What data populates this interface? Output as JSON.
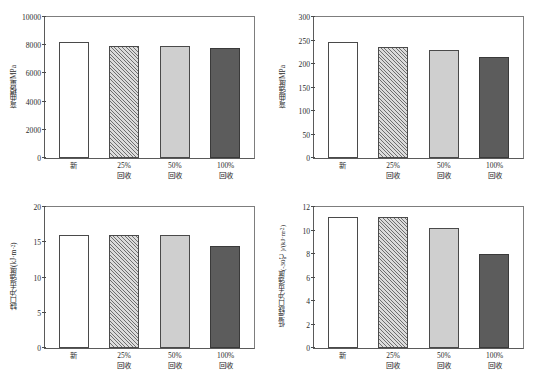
{
  "figure": {
    "panel_count": 4,
    "categories": [
      "新",
      "25%\n回收",
      "50%\n回收",
      "100%\n回收"
    ],
    "category_lines": [
      {
        "l1": "新",
        "l2": ""
      },
      {
        "l1": "25%",
        "l2": "回收"
      },
      {
        "l1": "50%",
        "l2": "回收"
      },
      {
        "l1": "100%",
        "l2": "回收"
      }
    ],
    "bar_styles": [
      "white-outline",
      "diagonal-hatch",
      "light-gray",
      "dark-gray"
    ],
    "colors": {
      "bar_white": "#ffffff",
      "bar_hatch_bg": "#dcdcdc",
      "bar_hatch_line": "#6f6f6f",
      "bar_light_gray": "#cfcfcf",
      "bar_dark_gray": "#5c5c5c",
      "axis": "#4a4a4a",
      "frame": "#5a5a5a",
      "text": "#2b2b2b",
      "background": "#ffffff"
    }
  },
  "chart_data": [
    {
      "id": "flexural-modulus",
      "type": "bar",
      "title": "",
      "xlabel": "",
      "ylabel": "弯曲模量/MPa",
      "ylabel_plain": "弯曲模量/MPa",
      "categories": [
        "新",
        "25%回收",
        "50%回收",
        "100%回收"
      ],
      "values": [
        8200,
        7970,
        7930,
        7800
      ],
      "ylim": [
        0,
        10000
      ],
      "yticks": [
        0,
        2000,
        4000,
        6000,
        8000,
        10000
      ],
      "ytick_labels": [
        "0",
        "2000",
        "4000",
        "6000",
        "8000",
        "10000"
      ],
      "grid": false,
      "legend": null
    },
    {
      "id": "flexural-strength",
      "type": "bar",
      "title": "",
      "xlabel": "",
      "ylabel": "弯曲强度/MPa",
      "ylabel_plain": "弯曲强度/MPa",
      "categories": [
        "新",
        "25%回收",
        "50%回收",
        "100%回收"
      ],
      "values": [
        246,
        236,
        229,
        215
      ],
      "ylim": [
        0,
        300
      ],
      "yticks": [
        0,
        50,
        100,
        150,
        200,
        250,
        300
      ],
      "ytick_labels": [
        "0",
        "50",
        "100",
        "150",
        "200",
        "250",
        "300"
      ],
      "grid": false,
      "legend": null
    },
    {
      "id": "notched-impact-strength",
      "type": "bar",
      "title": "",
      "xlabel": "",
      "ylabel": "缺口冲击强度/(kJ·m-2)",
      "ylabel_main": "缺口冲击强度/(kJ·m",
      "ylabel_sup": "-2",
      "ylabel_tail": ")",
      "categories": [
        "新",
        "25%回收",
        "50%回收",
        "100%回收"
      ],
      "values": [
        16.1,
        16.1,
        16.1,
        14.4
      ],
      "ylim": [
        0,
        20
      ],
      "yticks": [
        0,
        5,
        10,
        15,
        20
      ],
      "ytick_labels": [
        "0",
        "5",
        "10",
        "15",
        "20"
      ],
      "grid": false,
      "legend": null
    },
    {
      "id": "low-temperature-notched-impact-strength",
      "type": "bar",
      "title": "",
      "xlabel": "",
      "ylabel": "低温缺口冲击强度(-30℃)/(kJ·m-2)",
      "ylabel_main": "低温缺口冲击强度(-30℃)/(kJ·m",
      "ylabel_sup": "-2",
      "ylabel_tail": ")",
      "categories": [
        "新",
        "25%回收",
        "50%回收",
        "100%回收"
      ],
      "values": [
        11.15,
        11.15,
        10.2,
        8.0
      ],
      "ylim": [
        0,
        12
      ],
      "yticks": [
        0,
        2,
        4,
        6,
        8,
        10,
        12
      ],
      "ytick_labels": [
        "0",
        "2",
        "4",
        "6",
        "8",
        "10",
        "12"
      ],
      "grid": false,
      "legend": null
    }
  ]
}
